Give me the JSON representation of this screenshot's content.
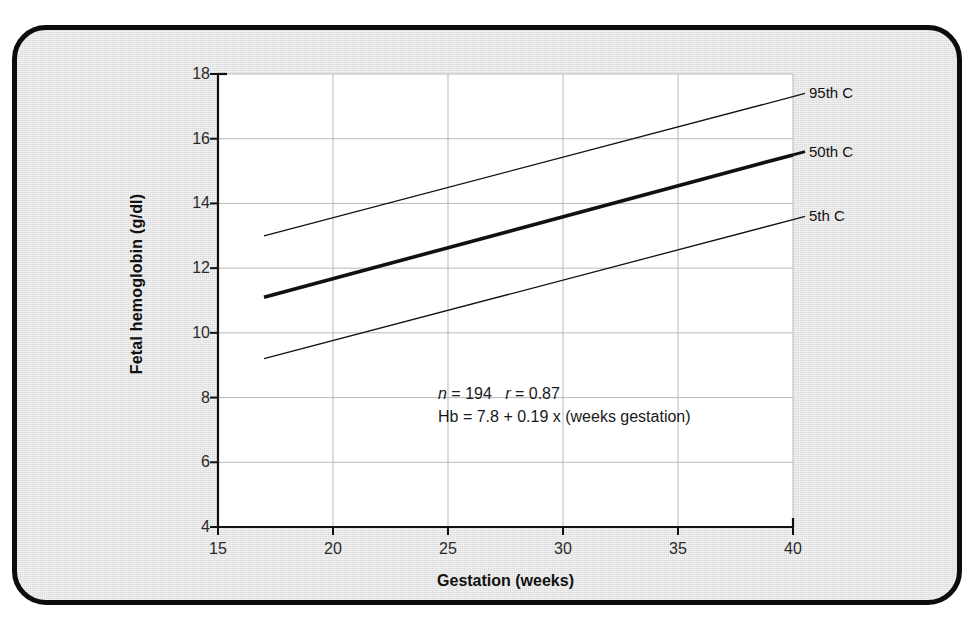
{
  "chart_data": {
    "type": "line",
    "title": "",
    "xlabel": "Gestation (weeks)",
    "ylabel": "Fetal hemoglobin (g/dl)",
    "xlim": [
      15,
      40
    ],
    "ylim": [
      4,
      18
    ],
    "xticks": [
      "15",
      "20",
      "25",
      "30",
      "35",
      "40"
    ],
    "yticks": [
      "4",
      "6",
      "8",
      "10",
      "12",
      "14",
      "16",
      "18"
    ],
    "grid": true,
    "legend_position": "right-inline-labels",
    "x": [
      17,
      40
    ],
    "series": [
      {
        "name": "95th C",
        "values": [
          13.0,
          17.3
        ],
        "style": "thin"
      },
      {
        "name": "50th C",
        "values": [
          11.1,
          15.5
        ],
        "style": "thick"
      },
      {
        "name": "5th C",
        "values": [
          9.2,
          13.5
        ],
        "style": "thin"
      }
    ],
    "annotations": {
      "line1_n_symbol": "n",
      "line1_n_value": "= 194",
      "line1_r_symbol": "r",
      "line1_r_value": "= 0.87",
      "line2": "Hb = 7.8 + 0.19 x (weeks gestation)"
    }
  },
  "colors": {
    "frame_border": "#0c0c0c",
    "page_background": "#dcdcdc",
    "plot_background": "#ffffff",
    "gridline": "#b9b9b9",
    "axis": "#111111",
    "series_line": "#111111"
  }
}
